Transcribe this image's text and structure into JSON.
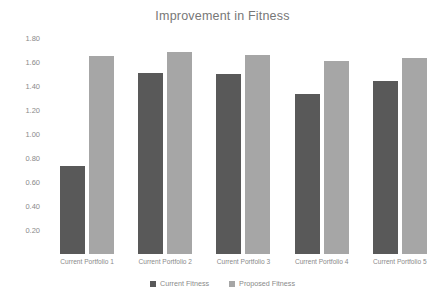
{
  "chart_data": {
    "type": "bar",
    "title": "Improvement in Fitness",
    "xlabel": "",
    "ylabel": "",
    "ylim": [
      0.0,
      1.8
    ],
    "ytick_labels": [
      "1.80",
      "1.60",
      "1.40",
      "1.20",
      "1.00",
      "0.80",
      "0.60",
      "0.40",
      "0.20"
    ],
    "ytick_values": [
      1.8,
      1.6,
      1.4,
      1.2,
      1.0,
      0.8,
      0.6,
      0.4,
      0.2
    ],
    "grid": false,
    "legend_position": "bottom",
    "categories": [
      "Current Portfolio 1",
      "Current Portfolio 2",
      "Current Portfolio 3",
      "Current Portfolio 4",
      "Current Portfolio 5"
    ],
    "series": [
      {
        "name": "Current Fitness",
        "color": "#595959",
        "values": [
          0.73,
          1.51,
          1.5,
          1.33,
          1.44
        ]
      },
      {
        "name": "Proposed Fitness",
        "color": "#a6a6a6",
        "values": [
          1.65,
          1.68,
          1.66,
          1.61,
          1.63
        ]
      }
    ]
  },
  "colors": {
    "background": "#ffffff",
    "title_text": "#777777",
    "tick_text": "#8a8a8a",
    "series_current": "#595959",
    "series_proposed": "#a6a6a6"
  }
}
